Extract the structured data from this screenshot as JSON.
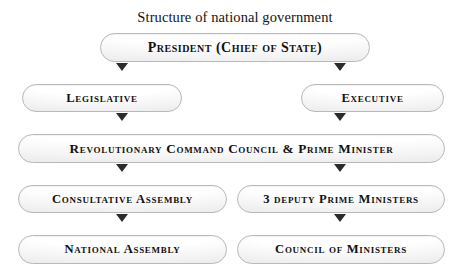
{
  "title": "Structure of national government",
  "nodes": {
    "president": "President (Chief of State)",
    "legislative": "Legislative",
    "executive": "Executive",
    "rcc": "Revolutionary Command Council & Prime Minister",
    "consultative_assembly": "Consultative Assembly",
    "deputy_pms": "3 deputy Prime Ministers",
    "national_assembly": "National Assembly",
    "council_of_ministers": "Council of Ministers"
  },
  "colors": {
    "node_border": "#b9b9b9",
    "node_fill_top": "#ffffff",
    "node_fill_bottom": "#e6e6e6",
    "arrow": "#2b2b2b",
    "text": "#111111"
  },
  "connectors": [
    {
      "from": "president",
      "to": "legislative"
    },
    {
      "from": "president",
      "to": "executive"
    },
    {
      "from": "legislative",
      "to": "rcc"
    },
    {
      "from": "executive",
      "to": "rcc"
    },
    {
      "from": "rcc",
      "to": "consultative_assembly"
    },
    {
      "from": "rcc",
      "to": "deputy_pms"
    },
    {
      "from": "consultative_assembly",
      "to": "national_assembly"
    },
    {
      "from": "deputy_pms",
      "to": "council_of_ministers"
    }
  ]
}
